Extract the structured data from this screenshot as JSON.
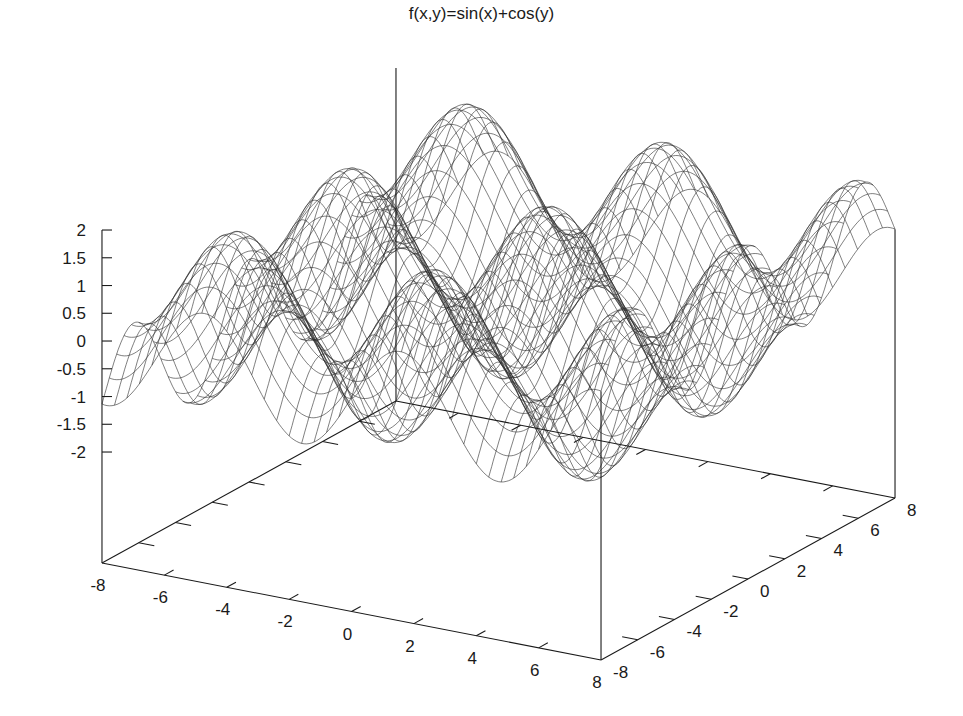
{
  "chart_data": {
    "type": "surface",
    "title": "f(x,y)=sin(x)+cos(y)",
    "function": "sin(x)+cos(y)",
    "xlabel": "",
    "ylabel": "",
    "zlabel": "",
    "xlim": [
      -8,
      8
    ],
    "ylim": [
      -8,
      8
    ],
    "zlim": [
      -2,
      2
    ],
    "x_ticks": [
      -8,
      -6,
      -4,
      -2,
      0,
      2,
      4,
      6,
      8
    ],
    "y_ticks": [
      -8,
      -6,
      -4,
      -2,
      0,
      2,
      4,
      6,
      8
    ],
    "z_ticks": [
      -2,
      -1.5,
      -1,
      -0.5,
      0,
      0.5,
      1,
      1.5,
      2
    ],
    "z_tick_labels": [
      "-2",
      "-1.5",
      "-1",
      "-0.5",
      "0",
      "0.5",
      "1",
      "1.5",
      "2"
    ],
    "grid_lines": 40,
    "style": "wireframe mesh, no hidden-line removal",
    "legend": "none",
    "colors": {
      "mesh": "#2a2a2a",
      "axes": "#1a1a1a",
      "background": "#ffffff"
    }
  }
}
